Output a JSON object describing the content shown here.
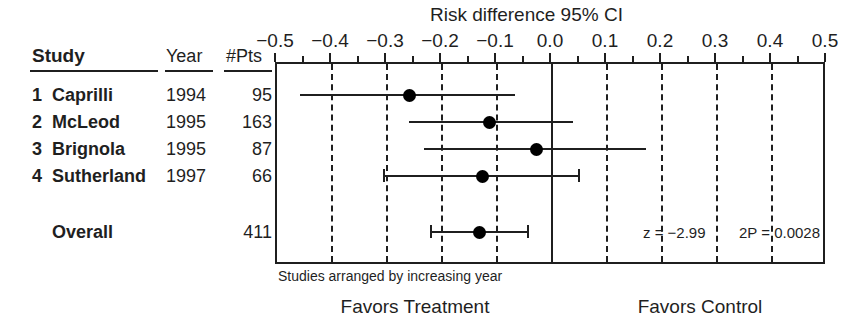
{
  "chart_data": {
    "type": "forest",
    "title": "Risk difference 95% CI",
    "xlabel": "",
    "ylabel": "",
    "xlim": [
      -0.5,
      0.5
    ],
    "grid": true,
    "tick_labels": [
      "−0.5",
      "−0.4",
      "−0.3",
      "−0.2",
      "−0.1",
      "0.0",
      "0.1",
      "0.2",
      "0.3",
      "0.4",
      "0.5"
    ],
    "tick_values": [
      -0.5,
      -0.4,
      -0.3,
      -0.2,
      -0.1,
      0.0,
      0.1,
      0.2,
      0.3,
      0.4,
      0.5
    ],
    "null_value": 0.0,
    "columns": [
      "Study",
      "Year",
      "#Pts"
    ],
    "rows": [
      {
        "index": "1",
        "name": "Caprilli",
        "year": "1994",
        "pts": "95",
        "estimate": -0.26,
        "ci_low": -0.458,
        "ci_high": -0.068,
        "caps": false
      },
      {
        "index": "2",
        "name": "McLeod",
        "year": "1995",
        "pts": "163",
        "estimate": -0.113,
        "ci_low": -0.26,
        "ci_high": 0.038,
        "caps": false
      },
      {
        "index": "3",
        "name": "Brignola",
        "year": "1995",
        "pts": "87",
        "estimate": -0.028,
        "ci_low": -0.233,
        "ci_high": 0.171,
        "caps": false
      },
      {
        "index": "4",
        "name": "Sutherland",
        "year": "1997",
        "pts": "66",
        "estimate": -0.127,
        "ci_low": -0.305,
        "ci_high": 0.049,
        "caps": true
      }
    ],
    "overall": {
      "label": "Overall",
      "pts": "411",
      "estimate": -0.132,
      "ci_low": -0.22,
      "ci_high": -0.043,
      "caps": true
    },
    "annotations": {
      "z": "z = −2.99",
      "p": "2P = 0.0028"
    },
    "footnote": "Studies arranged by increasing year",
    "favors_left": "Favors Treatment",
    "favors_right": "Favors Control"
  },
  "colors": {
    "ink": "#1f1f1f",
    "marker": "#000000",
    "background": "#ffffff"
  }
}
